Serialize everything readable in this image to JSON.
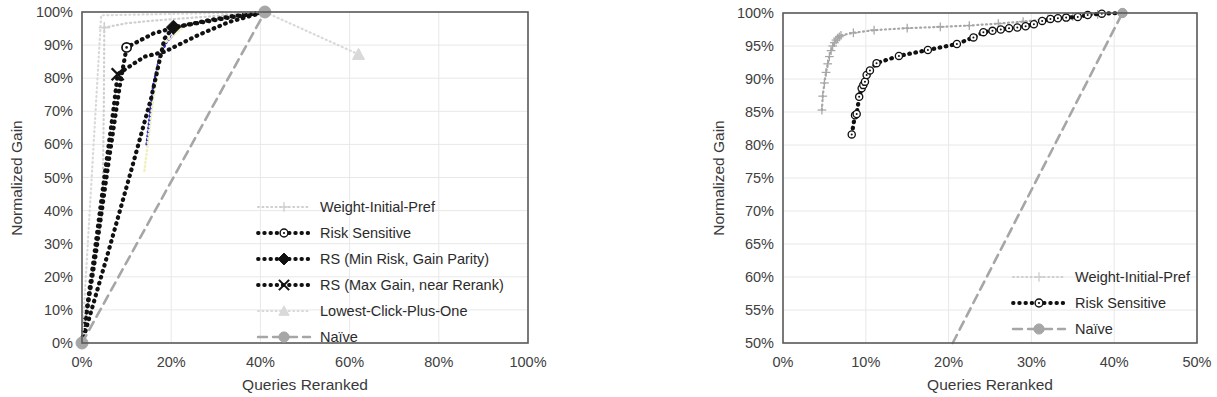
{
  "figure": {
    "background_color": "#ffffff",
    "panels": [
      "left",
      "right"
    ]
  },
  "colors": {
    "dark": "#111111",
    "gray": "#a6a6a6",
    "light_gray": "#cfcfcf",
    "very_light": "#d9d9d9",
    "blue": "#2b2bc8",
    "pale_yellow": "#f2f0c0",
    "axis": "#5a5a5a",
    "grid": "#e8e8e8",
    "text": "#3a3a3a"
  },
  "chart_data": [
    {
      "id": "left",
      "type": "line",
      "title": "",
      "xlabel": "Queries Reranked",
      "ylabel": "Normalized Gain",
      "xlim": [
        0,
        100
      ],
      "ylim": [
        0,
        100
      ],
      "xticks": [
        "0%",
        "20%",
        "40%",
        "60%",
        "80%",
        "100%"
      ],
      "xtick_values": [
        0,
        20,
        40,
        60,
        80,
        100
      ],
      "yticks": [
        "0%",
        "10%",
        "20%",
        "30%",
        "40%",
        "50%",
        "60%",
        "70%",
        "80%",
        "90%",
        "100%"
      ],
      "ytick_values": [
        0,
        10,
        20,
        30,
        40,
        50,
        60,
        70,
        80,
        90,
        100
      ],
      "grid": true,
      "legend_position": "inside-lower-right",
      "series": [
        {
          "name": "Weight-Initial-Pref",
          "color": "#cfcfcf",
          "style": "dotted",
          "marker": "plus",
          "marker_points": [
            [
              5.0,
              95.3
            ]
          ],
          "points": [
            [
              0,
              0
            ],
            [
              4.6,
              40.0
            ],
            [
              4.9,
              72.0
            ],
            [
              5.0,
              95.3
            ],
            [
              10.0,
              96.6
            ],
            [
              16.0,
              97.4
            ],
            [
              22.0,
              98.0
            ],
            [
              28.0,
              98.6
            ],
            [
              34.0,
              99.2
            ],
            [
              41.0,
              100.0
            ]
          ]
        },
        {
          "name": "Risk Sensitive",
          "color": "#111111",
          "style": "dotted",
          "marker": "circle-open",
          "marker_points": [
            [
              10.0,
              89.3
            ]
          ],
          "points": [
            [
              0,
              0
            ],
            [
              3.0,
              26.0
            ],
            [
              6.0,
              55.0
            ],
            [
              8.5,
              78.0
            ],
            [
              10.0,
              89.3
            ],
            [
              16.0,
              93.5
            ],
            [
              21.0,
              95.4
            ],
            [
              28.0,
              97.4
            ],
            [
              34.0,
              98.8
            ],
            [
              41.0,
              100.0
            ]
          ]
        },
        {
          "name": "RS (Min Risk, Gain Parity)",
          "color": "#111111",
          "style": "dotted",
          "marker": "diamond-filled",
          "marker_points": [
            [
              20.5,
              95.4
            ]
          ],
          "points": [
            [
              0,
              0
            ],
            [
              6.0,
              28.0
            ],
            [
              11.0,
              52.0
            ],
            [
              15.5,
              74.0
            ],
            [
              17.5,
              86.0
            ],
            [
              18.5,
              92.0
            ],
            [
              20.5,
              95.4
            ],
            [
              27.0,
              96.9
            ],
            [
              33.0,
              98.3
            ],
            [
              41.0,
              100.0
            ]
          ]
        },
        {
          "name": "RS (Max Gain, near Rerank)",
          "color": "#111111",
          "style": "dotted",
          "marker": "x",
          "marker_points": [
            [
              8.0,
              81.2
            ]
          ],
          "points": [
            [
              0,
              0
            ],
            [
              2.5,
              24.0
            ],
            [
              5.0,
              50.0
            ],
            [
              7.0,
              70.0
            ],
            [
              8.0,
              81.2
            ],
            [
              14.0,
              86.5
            ],
            [
              18.5,
              88.0
            ],
            [
              26.0,
              93.0
            ],
            [
              33.0,
              97.0
            ],
            [
              41.0,
              100.0
            ]
          ]
        },
        {
          "name": "Lowest-Click-Plus-One",
          "color": "#d9d9d9",
          "style": "dotted",
          "marker": "triangle",
          "marker_points": [
            [
              62.0,
              87.2
            ]
          ],
          "points": [
            [
              0,
              0
            ],
            [
              4.3,
              99.0
            ],
            [
              41.0,
              100.0
            ],
            [
              62.0,
              87.2
            ]
          ]
        },
        {
          "name": "Naïve",
          "color": "#a6a6a6",
          "style": "dashed",
          "marker": "circle-filled",
          "marker_points": [
            [
              0,
              0
            ],
            [
              41.0,
              100.0
            ]
          ],
          "points": [
            [
              0,
              0
            ],
            [
              41.0,
              100.0
            ]
          ]
        }
      ],
      "extra_paths": [
        {
          "name": "blue-thin",
          "color": "#2b2bc8",
          "points": [
            [
              14.5,
              60.0
            ],
            [
              16.0,
              78.0
            ],
            [
              17.5,
              87.0
            ],
            [
              19.0,
              91.0
            ],
            [
              21.0,
              94.0
            ]
          ]
        },
        {
          "name": "pale-yellow-thin",
          "color": "#f2f0c0",
          "points": [
            [
              14.0,
              52.0
            ],
            [
              16.0,
              74.0
            ],
            [
              18.0,
              90.0
            ],
            [
              24.0,
              97.0
            ]
          ]
        }
      ],
      "legend": [
        {
          "label": "Weight-Initial-Pref",
          "color": "#cfcfcf",
          "marker": "plus",
          "style": "dotted"
        },
        {
          "label": "Risk Sensitive",
          "color": "#111111",
          "marker": "circle-open",
          "style": "dotted"
        },
        {
          "label": "RS (Min Risk, Gain Parity)",
          "color": "#111111",
          "marker": "diamond-filled",
          "style": "dotted"
        },
        {
          "label": "RS (Max Gain, near Rerank)",
          "color": "#111111",
          "marker": "x",
          "style": "dotted"
        },
        {
          "label": "Lowest-Click-Plus-One",
          "color": "#d9d9d9",
          "marker": "triangle",
          "style": "dotted"
        },
        {
          "label": "Naïve",
          "color": "#a6a6a6",
          "marker": "circle-filled",
          "style": "dashed"
        }
      ]
    },
    {
      "id": "right",
      "type": "line",
      "title": "",
      "xlabel": "Queries Reranked",
      "ylabel": "Normalized Gain",
      "xlim": [
        0,
        50
      ],
      "ylim": [
        50,
        100
      ],
      "xticks": [
        "0%",
        "10%",
        "20%",
        "30%",
        "40%",
        "50%"
      ],
      "xtick_values": [
        0,
        10,
        20,
        30,
        40,
        50
      ],
      "yticks": [
        "50%",
        "55%",
        "60%",
        "65%",
        "70%",
        "75%",
        "80%",
        "85%",
        "90%",
        "95%",
        "100%"
      ],
      "ytick_values": [
        50,
        55,
        60,
        65,
        70,
        75,
        80,
        85,
        90,
        95,
        100
      ],
      "grid": true,
      "legend_position": "inside-lower-right",
      "series": [
        {
          "name": "Weight-Initial-Pref",
          "color": "#a6a6a6",
          "style": "dotted",
          "marker": "plus",
          "points": [
            [
              4.7,
              85.3
            ],
            [
              4.8,
              87.4
            ],
            [
              5.0,
              89.4
            ],
            [
              5.2,
              91.0
            ],
            [
              5.4,
              92.3
            ],
            [
              5.6,
              93.4
            ],
            [
              5.8,
              94.3
            ],
            [
              6.0,
              95.0
            ],
            [
              6.2,
              95.5
            ],
            [
              6.4,
              95.9
            ],
            [
              6.6,
              96.2
            ],
            [
              6.8,
              96.4
            ],
            [
              7.0,
              96.6
            ],
            [
              8.5,
              97.0
            ],
            [
              11.0,
              97.4
            ],
            [
              15.0,
              97.7
            ],
            [
              19.0,
              97.9
            ],
            [
              22.5,
              98.1
            ],
            [
              26.0,
              98.4
            ],
            [
              29.0,
              98.7
            ],
            [
              32.0,
              99.1
            ],
            [
              35.0,
              99.5
            ],
            [
              38.0,
              99.8
            ],
            [
              41.0,
              100.0
            ]
          ]
        },
        {
          "name": "Risk Sensitive",
          "color": "#111111",
          "style": "dotted",
          "marker": "circle-open",
          "points": [
            [
              8.3,
              81.6
            ],
            [
              8.7,
              84.5
            ],
            [
              8.9,
              84.7
            ],
            [
              9.2,
              87.3
            ],
            [
              9.5,
              88.6
            ],
            [
              9.7,
              89.1
            ],
            [
              9.9,
              89.6
            ],
            [
              10.1,
              90.6
            ],
            [
              10.5,
              91.3
            ],
            [
              11.3,
              92.4
            ],
            [
              14.0,
              93.5
            ],
            [
              17.5,
              94.4
            ],
            [
              21.0,
              95.3
            ],
            [
              23.0,
              96.3
            ],
            [
              24.2,
              97.1
            ],
            [
              25.3,
              97.3
            ],
            [
              26.3,
              97.5
            ],
            [
              27.3,
              97.7
            ],
            [
              28.3,
              97.8
            ],
            [
              29.3,
              98.0
            ],
            [
              30.3,
              98.3
            ],
            [
              31.3,
              98.8
            ],
            [
              32.3,
              99.1
            ],
            [
              33.2,
              99.2
            ],
            [
              34.2,
              99.3
            ],
            [
              35.6,
              99.4
            ],
            [
              36.8,
              99.7
            ],
            [
              38.5,
              99.9
            ],
            [
              41.0,
              100.0
            ]
          ]
        },
        {
          "name": "Naïve",
          "color": "#a6a6a6",
          "style": "dashed",
          "marker": "circle-filled",
          "marker_points": [
            [
              41.0,
              100.0
            ]
          ],
          "points": [
            [
              20.5,
              50.0
            ],
            [
              41.0,
              100.0
            ]
          ]
        }
      ],
      "legend": [
        {
          "label": "Weight-Initial-Pref",
          "color": "#cfcfcf",
          "marker": "plus",
          "style": "dotted"
        },
        {
          "label": "Risk Sensitive",
          "color": "#111111",
          "marker": "circle-open",
          "style": "dotted"
        },
        {
          "label": "Naïve",
          "color": "#a6a6a6",
          "marker": "circle-filled",
          "style": "dashed"
        }
      ]
    }
  ]
}
